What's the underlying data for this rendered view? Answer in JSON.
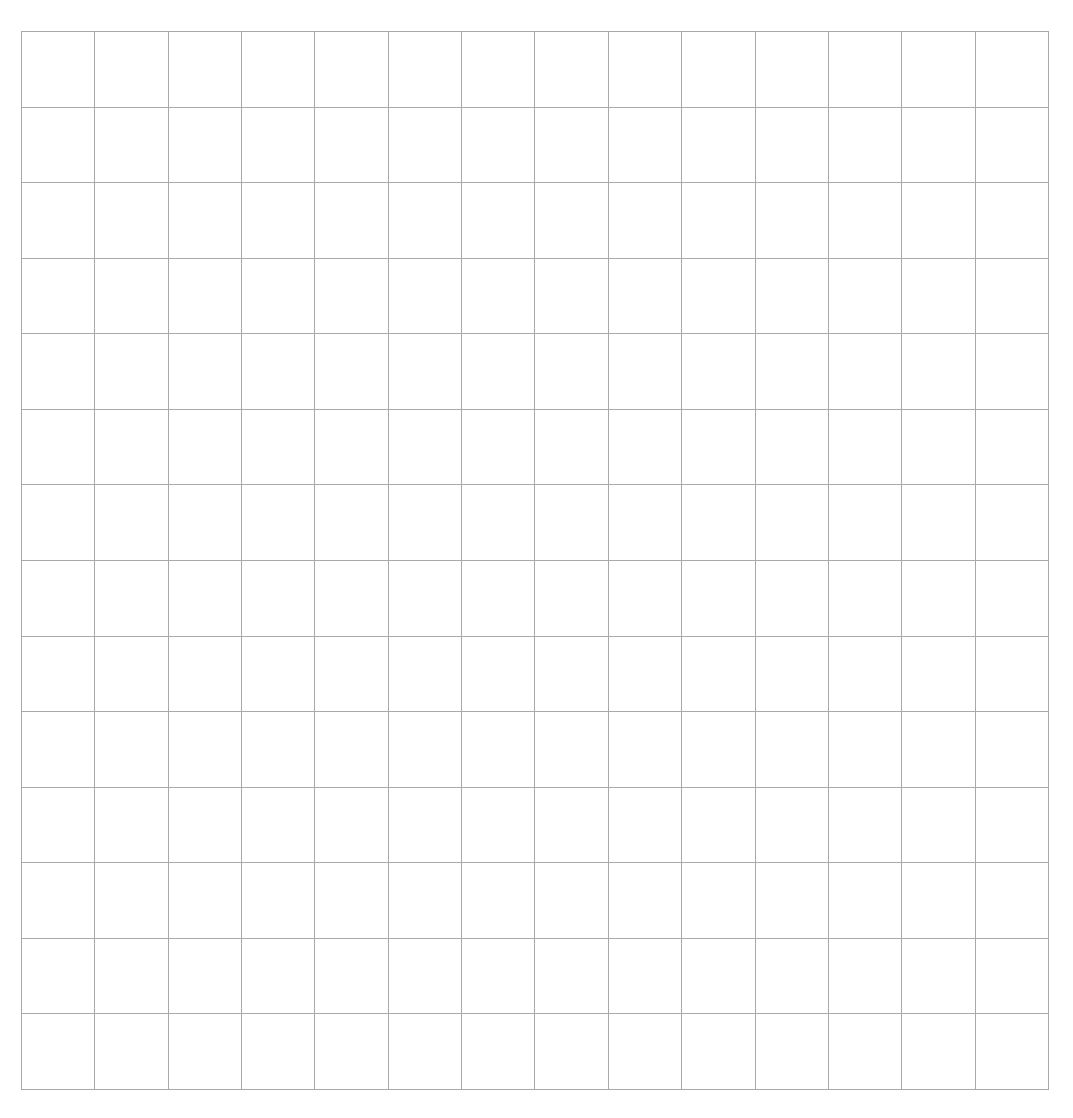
{
  "grid": {
    "rows": 14,
    "columns": 14,
    "line_color": "#a9a9a9",
    "background_color": "#ffffff",
    "cells_filled": 0
  }
}
